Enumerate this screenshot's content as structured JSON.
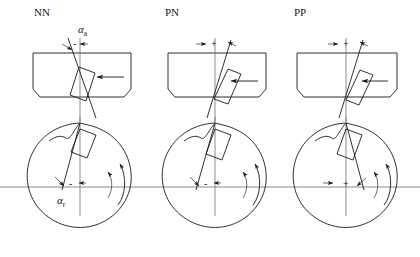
{
  "figure": {
    "background_color": "#ffffff",
    "line_color": "#1a1a1a",
    "axis_color": "#7d7d7d",
    "width": 420,
    "height": 257
  },
  "panels": [
    {
      "id": "nn",
      "label": "NN",
      "label_x": 34,
      "label_y": 16,
      "top_view": {
        "sign": "-",
        "sign_x": 73,
        "sign_y": 44,
        "angle_label": "α",
        "angle_subscript": "a",
        "angle_label_x": 78,
        "angle_label_y": 33,
        "tool_tilt_deg": -16,
        "feed_arrow_direction": "left"
      },
      "end_view": {
        "sign": "-",
        "sign_x": 71,
        "sign_y": 190,
        "angle_label": "α",
        "angle_subscript": "r",
        "angle_label_x": 57,
        "angle_label_y": 203,
        "tool_tilt_deg": -14,
        "rotation_direction": "counterclockwise"
      }
    },
    {
      "id": "pn",
      "label": "PN",
      "label_x": 165,
      "label_y": 16,
      "top_view": {
        "sign": "+",
        "sign_x": 213,
        "sign_y": 44,
        "angle_label": "",
        "angle_subscript": "",
        "tool_tilt_deg": 16,
        "feed_arrow_direction": "left"
      },
      "end_view": {
        "sign": "-",
        "sign_x": 206,
        "sign_y": 190,
        "angle_label": "",
        "angle_subscript": "",
        "tool_tilt_deg": -14,
        "rotation_direction": "counterclockwise"
      }
    },
    {
      "id": "pp",
      "label": "PP",
      "label_x": 294,
      "label_y": 16,
      "top_view": {
        "sign": "+",
        "sign_x": 347,
        "sign_y": 44,
        "angle_label": "",
        "angle_subscript": "",
        "tool_tilt_deg": 16,
        "feed_arrow_direction": "left"
      },
      "end_view": {
        "sign": "+",
        "sign_x": 345,
        "sign_y": 190,
        "angle_label": "",
        "angle_subscript": "",
        "tool_tilt_deg": 16,
        "rotation_direction": "counterclockwise"
      }
    }
  ],
  "legend": {
    "axial_rake_symbol": "αa",
    "radial_rake_symbol": "αr",
    "negative_sign": "-",
    "positive_sign": "+"
  }
}
